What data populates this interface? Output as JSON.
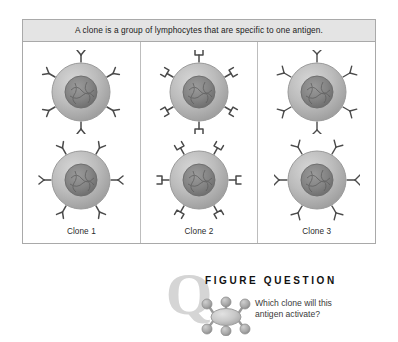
{
  "figure": {
    "caption": "A clone is a group of lymphocytes that are specific to one antigen.",
    "columns": [
      {
        "label": "Clone 1",
        "receptor_tip": "cupped-v",
        "cells": [
          {
            "name": "lymphocyte",
            "receptor_count": 6
          },
          {
            "name": "lymphocyte",
            "receptor_count": 6
          }
        ]
      },
      {
        "label": "Clone 2",
        "receptor_tip": "square-bracket",
        "cells": [
          {
            "name": "lymphocyte",
            "receptor_count": 6
          },
          {
            "name": "lymphocyte",
            "receptor_count": 6
          }
        ]
      },
      {
        "label": "Clone 3",
        "receptor_tip": "pointed-arrow",
        "cells": [
          {
            "name": "lymphocyte",
            "receptor_count": 6
          },
          {
            "name": "lymphocyte",
            "receptor_count": 6
          }
        ]
      }
    ]
  },
  "figure_question": {
    "logo_letter": "Q",
    "title": "FIGURE QUESTION",
    "antigen_icon": "antigen-molecule-icon",
    "question_lines": [
      "Which clone will this",
      "antigen activate?"
    ]
  },
  "colors": {
    "caption_background": "#e4e4e4",
    "table_border": "#a9a9a9",
    "cell_membrane": "#b4b4b4",
    "cell_nucleus": "#8a8a8a",
    "receptor_stroke": "#4a4a4a",
    "q_logo": "#d5d5d5",
    "title_text": "#111111",
    "question_text": "#3a3a3a"
  }
}
